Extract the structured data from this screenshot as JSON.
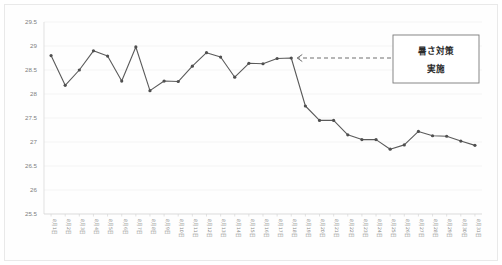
{
  "chart_data": {
    "type": "line",
    "title": "",
    "xlabel": "",
    "ylabel": "",
    "ylim": [
      25.5,
      29.5
    ],
    "ytick_step": 0.5,
    "yticks": [
      "29.5",
      "29",
      "28.5",
      "28",
      "27.5",
      "27",
      "26.5",
      "26",
      "25.5"
    ],
    "grid": true,
    "legend": "none",
    "categories": [
      "8月1日",
      "8月2日",
      "8月3日",
      "8月4日",
      "8月5日",
      "8月6日",
      "8月7日",
      "8月8日",
      "8月9日",
      "8月10日",
      "8月11日",
      "8月12日",
      "8月13日",
      "8月14日",
      "8月15日",
      "8月16日",
      "8月17日",
      "8月18日",
      "8月19日",
      "8月20日",
      "8月21日",
      "8月22日",
      "8月23日",
      "8月24日",
      "8月25日",
      "8月26日",
      "8月27日",
      "8月28日",
      "8月29日",
      "8月30日",
      "8月31日"
    ],
    "values": [
      28.8,
      28.18,
      28.5,
      28.9,
      28.79,
      28.27,
      28.98,
      28.07,
      28.27,
      28.26,
      28.58,
      28.86,
      28.77,
      28.35,
      28.64,
      28.63,
      28.74,
      28.75,
      27.75,
      27.45,
      27.45,
      27.15,
      27.05,
      27.05,
      26.85,
      26.94,
      27.22,
      27.13,
      27.12,
      27.02,
      26.93
    ],
    "series": [
      {
        "name": "気温",
        "color": "#5a5a5a",
        "marker": "circle"
      }
    ],
    "annotations": [
      {
        "name": "heat-countermeasure-note",
        "line1": "暑さ対策",
        "line2": "実施",
        "points_to_category": "8月18日",
        "arrow_style": "dashed-left-arrow",
        "box_color": "#ffffff",
        "border_color": "#7a7a7a"
      }
    ]
  },
  "colors": {
    "line": "#5a5a5a",
    "marker": "#4f4f4f",
    "grid": "#f1f1f1",
    "axis": "#d6d6d6",
    "tick_text": "#808080",
    "annotation_text": "#2b2b2b",
    "background": "#ffffff"
  }
}
